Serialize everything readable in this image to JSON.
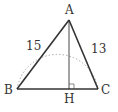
{
  "diagram": {
    "type": "triangle-with-altitude",
    "vertices": {
      "A": {
        "label": "A",
        "x": 69,
        "y": 20
      },
      "B": {
        "label": "B",
        "x": 17,
        "y": 89
      },
      "C": {
        "label": "C",
        "x": 98,
        "y": 89
      },
      "H": {
        "label": "H",
        "x": 69,
        "y": 89
      }
    },
    "side_labels": {
      "AB": "15",
      "AC": "13"
    },
    "right_angle_at": "H",
    "colors": {
      "line": "#333333",
      "arc": "#aaaaaa",
      "background": "#ffffff"
    }
  }
}
